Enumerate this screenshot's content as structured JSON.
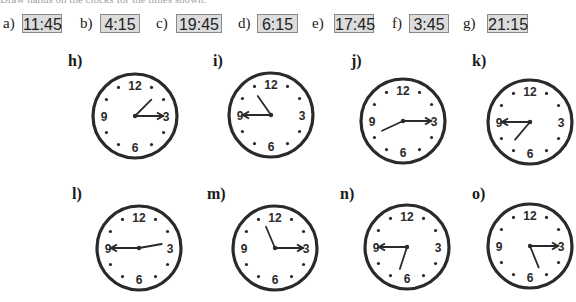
{
  "heading_cropped": "Draw hands on the clocks for the times shown.",
  "options": [
    {
      "label": "a)",
      "time": "11:45",
      "label_x": 3,
      "box_x": 22,
      "box_w": 40
    },
    {
      "label": "b)",
      "time": "4:15",
      "label_x": 80,
      "box_x": 100,
      "box_w": 40
    },
    {
      "label": "c)",
      "time": "19:45",
      "label_x": 156,
      "box_x": 176,
      "box_w": 46
    },
    {
      "label": "d)",
      "time": "6:15",
      "label_x": 238,
      "box_x": 257,
      "box_w": 41
    },
    {
      "label": "e)",
      "time": "17:45",
      "label_x": 312,
      "box_x": 334,
      "box_w": 40
    },
    {
      "label": "f)",
      "time": "3:45",
      "label_x": 392,
      "box_x": 409,
      "box_w": 40
    },
    {
      "label": "g)",
      "time": "21:15",
      "label_x": 463,
      "box_x": 487,
      "box_w": 41
    }
  ],
  "clocks": [
    {
      "label": "h)",
      "label_x": 68,
      "label_y": 52,
      "cx": 135,
      "cy": 116,
      "hour_deg": 45,
      "minute_deg": 90,
      "shown_time": "1:15"
    },
    {
      "label": "i)",
      "label_x": 213,
      "label_y": 52,
      "cx": 271,
      "cy": 115,
      "hour_deg": 325,
      "minute_deg": 270,
      "shown_time": "10:45"
    },
    {
      "label": "j)",
      "label_x": 351,
      "label_y": 52,
      "cx": 403,
      "cy": 121,
      "hour_deg": 245,
      "minute_deg": 90,
      "shown_time": "8:15"
    },
    {
      "label": "k)",
      "label_x": 472,
      "label_y": 52,
      "cx": 530,
      "cy": 122,
      "hour_deg": 220,
      "minute_deg": 270,
      "shown_time": "7:45"
    },
    {
      "label": "l)",
      "label_x": 72,
      "label_y": 185,
      "cx": 139,
      "cy": 248,
      "hour_deg": 80,
      "minute_deg": 270,
      "shown_time": "2:45"
    },
    {
      "label": "m)",
      "label_x": 207,
      "label_y": 185,
      "cx": 275,
      "cy": 248,
      "hour_deg": 337,
      "minute_deg": 90,
      "shown_time": "11:15"
    },
    {
      "label": "n)",
      "label_x": 340,
      "label_y": 185,
      "cx": 407,
      "cy": 247,
      "hour_deg": 198,
      "minute_deg": 270,
      "shown_time": "5:45"
    },
    {
      "label": "o)",
      "label_x": 472,
      "label_y": 185,
      "cx": 530,
      "cy": 246,
      "hour_deg": 158,
      "minute_deg": 90,
      "shown_time": "5:15"
    }
  ],
  "dial": {
    "numbers": [
      "12",
      "3",
      "6",
      "9"
    ],
    "radius": 42
  },
  "colors": {
    "ink": "#2a2a2a",
    "box_bg": "#dcdcdc",
    "box_border": "#8a8a8a"
  }
}
